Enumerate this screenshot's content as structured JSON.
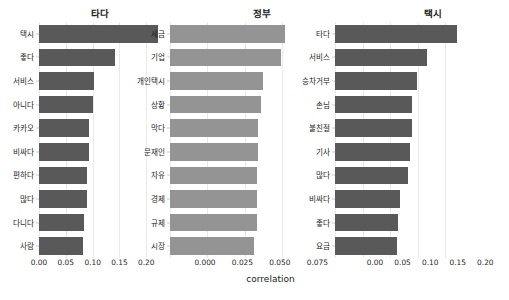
{
  "figure": {
    "suptitle": "",
    "xaxis_title": "correlation",
    "bar_color_dark": "#595959",
    "bar_color_light": "#949494",
    "grid_color": "#e9e9e9",
    "background": "#ffffff"
  },
  "chart_data": [
    {
      "type": "bar",
      "orientation": "horizontal",
      "title": "타다",
      "xlabel": "correlation",
      "ylabel": "",
      "xlim": [
        0.0,
        0.235
      ],
      "xticks": [
        0.0,
        0.05,
        0.1,
        0.15,
        0.2
      ],
      "xtick_labels": [
        "0.00",
        "0.05",
        "0.10",
        "0.15",
        "0.20"
      ],
      "grid": true,
      "legend": "none",
      "color": "#595959",
      "categories": [
        "택시",
        "좋다",
        "서비스",
        "아니다",
        "카카오",
        "비싸다",
        "편하다",
        "많다",
        "다니다",
        "사람"
      ],
      "values": [
        0.222,
        0.141,
        0.102,
        0.101,
        0.094,
        0.093,
        0.09,
        0.089,
        0.083,
        0.082
      ]
    },
    {
      "type": "bar",
      "orientation": "horizontal",
      "title": "정부",
      "xlabel": "correlation",
      "ylabel": "",
      "xlim": [
        0.0,
        0.0835
      ],
      "xticks": [
        0.0,
        0.025,
        0.05,
        0.075
      ],
      "xtick_labels": [
        "0.000",
        "0.025",
        "0.050",
        "0.075"
      ],
      "grid": true,
      "legend": "none",
      "color": "#949494",
      "categories": [
        "세금",
        "기업",
        "개인택시",
        "상황",
        "막다",
        "문재인",
        "자유",
        "경제",
        "규제",
        "시장"
      ],
      "values": [
        0.077,
        0.074,
        0.062,
        0.061,
        0.059,
        0.059,
        0.058,
        0.058,
        0.058,
        0.056
      ]
    },
    {
      "type": "bar",
      "orientation": "horizontal",
      "title": "택시",
      "xlabel": "correlation",
      "ylabel": "",
      "xlim": [
        0.0,
        0.232
      ],
      "xticks": [
        0.0,
        0.05,
        0.1,
        0.15,
        0.2
      ],
      "xtick_labels": [
        "0.00",
        "0.05",
        "0.10",
        "0.15",
        "0.20"
      ],
      "grid": true,
      "legend": "none",
      "color": "#595959",
      "categories": [
        "타다",
        "서비스",
        "승차거부",
        "손님",
        "불친절",
        "기사",
        "많다",
        "비싸다",
        "좋다",
        "요금"
      ],
      "values": [
        0.222,
        0.167,
        0.148,
        0.14,
        0.139,
        0.136,
        0.133,
        0.117,
        0.114,
        0.113
      ]
    }
  ]
}
